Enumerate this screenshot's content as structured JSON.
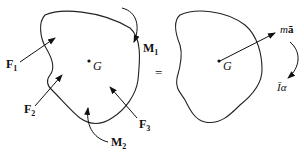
{
  "diagram": {
    "type": "free-body-diagram-equivalence",
    "left_body": {
      "center_label": "G",
      "forces": [
        {
          "name": "F",
          "sub": "1"
        },
        {
          "name": "F",
          "sub": "2"
        },
        {
          "name": "F",
          "sub": "3"
        }
      ],
      "moments": [
        {
          "name": "M",
          "sub": "1"
        },
        {
          "name": "M",
          "sub": "2"
        }
      ]
    },
    "equals_sign": "=",
    "right_body": {
      "center_label": "G",
      "resultant_force": {
        "m": "m",
        "a": "ā"
      },
      "resultant_moment": {
        "I": "Ī",
        "alpha": "α"
      }
    }
  }
}
